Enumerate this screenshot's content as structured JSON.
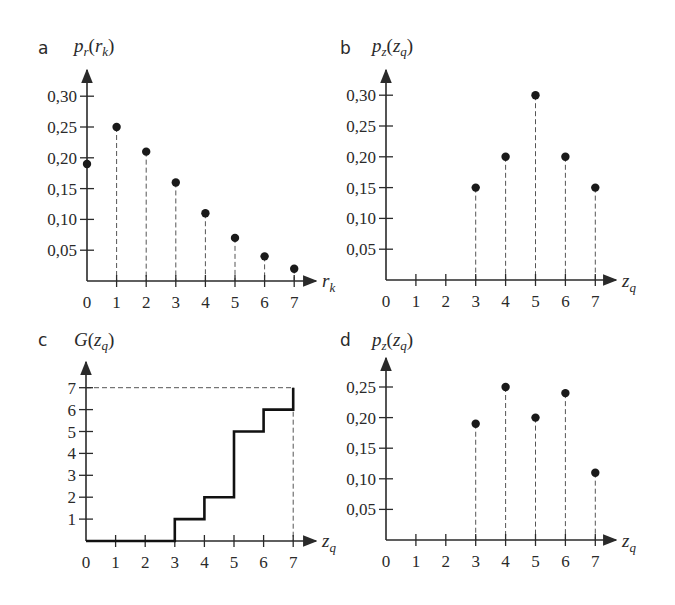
{
  "panels": {
    "a": {
      "letter": "a",
      "ylabel_main": "p",
      "ylabel_sub": "r",
      "ylabel_arg": "r",
      "ylabel_arg_sub": "k",
      "xlabel_main": "r",
      "xlabel_sub": "k"
    },
    "b": {
      "letter": "b",
      "ylabel_main": "p",
      "ylabel_sub": "z",
      "ylabel_arg": "z",
      "ylabel_arg_sub": "q",
      "xlabel_main": "z",
      "xlabel_sub": "q"
    },
    "c": {
      "letter": "c",
      "ylabel_main": "G",
      "ylabel_sub": "",
      "ylabel_arg": "z",
      "ylabel_arg_sub": "q",
      "xlabel_main": "z",
      "xlabel_sub": "q"
    },
    "d": {
      "letter": "d",
      "ylabel_main": "p",
      "ylabel_sub": "z",
      "ylabel_arg": "z",
      "ylabel_arg_sub": "q",
      "xlabel_main": "z",
      "xlabel_sub": "q"
    }
  },
  "chart_data": [
    {
      "panel": "a",
      "type": "scatter",
      "style": "stem (dashed drop lines)",
      "title": "",
      "xlabel": "r_k",
      "ylabel": "p_r(r_k)",
      "x": [
        0,
        1,
        2,
        3,
        4,
        5,
        6,
        7
      ],
      "values": [
        0.19,
        0.25,
        0.21,
        0.16,
        0.11,
        0.07,
        0.04,
        0.02
      ],
      "xticks": [
        "0",
        "1",
        "2",
        "3",
        "4",
        "5",
        "6",
        "7"
      ],
      "yticks": [
        "0,05",
        "0,10",
        "0,15",
        "0,20",
        "0,25",
        "0,30"
      ],
      "ylim": [
        0,
        0.32
      ],
      "grid": false
    },
    {
      "panel": "b",
      "type": "scatter",
      "style": "stem (dashed drop lines)",
      "title": "",
      "xlabel": "z_q",
      "ylabel": "p_z(z_q)",
      "x": [
        3,
        4,
        5,
        6,
        7
      ],
      "values": [
        0.15,
        0.2,
        0.3,
        0.2,
        0.15
      ],
      "xticks": [
        "0",
        "1",
        "2",
        "3",
        "4",
        "5",
        "6",
        "7"
      ],
      "yticks": [
        "0,05",
        "0,10",
        "0,15",
        "0,20",
        "0,25",
        "0,30"
      ],
      "ylim": [
        0,
        0.32
      ],
      "grid": false
    },
    {
      "panel": "c",
      "type": "line",
      "style": "step",
      "title": "",
      "xlabel": "z_q",
      "ylabel": "G(z_q)",
      "x": [
        0,
        1,
        2,
        3,
        4,
        5,
        6,
        7
      ],
      "values": [
        0,
        0,
        0,
        1,
        2,
        5,
        6,
        7
      ],
      "xticks": [
        "0",
        "1",
        "2",
        "3",
        "4",
        "5",
        "6",
        "7"
      ],
      "yticks": [
        "1",
        "2",
        "3",
        "4",
        "5",
        "6",
        "7"
      ],
      "ylim": [
        0,
        7.5
      ],
      "annotations": [
        "dashed guide lines at y=7 and x=7"
      ],
      "grid": false
    },
    {
      "panel": "d",
      "type": "scatter",
      "style": "stem (dashed drop lines)",
      "title": "",
      "xlabel": "z_q",
      "ylabel": "p_z(z_q)",
      "x": [
        3,
        4,
        5,
        6,
        7
      ],
      "values": [
        0.19,
        0.25,
        0.2,
        0.24,
        0.11
      ],
      "xticks": [
        "0",
        "1",
        "2",
        "3",
        "4",
        "5",
        "6",
        "7"
      ],
      "yticks": [
        "0,05",
        "0,10",
        "0,15",
        "0,20",
        "0,25"
      ],
      "ylim": [
        0,
        0.27
      ],
      "grid": false
    }
  ]
}
